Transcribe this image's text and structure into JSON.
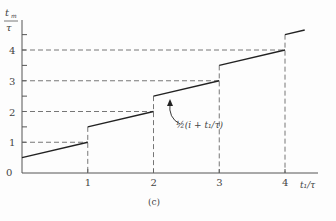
{
  "chart_data": {
    "type": "line",
    "title": "",
    "caption": "(c)",
    "xlabel": "t₁/τ",
    "ylabel_num": "t",
    "ylabel_sub": "m",
    "ylabel_den": "τ",
    "xlim": [
      0,
      4.35
    ],
    "ylim": [
      0,
      4.6
    ],
    "x_ticks": [
      0,
      1,
      2,
      3,
      4
    ],
    "x_tick_labels": [
      "0",
      "1",
      "2",
      "3",
      "4"
    ],
    "y_ticks": [
      1,
      2,
      3,
      4
    ],
    "y_tick_labels": [
      "1",
      "2",
      "3",
      "4"
    ],
    "y_minor_ticks": [
      1.5,
      2.5,
      3.5,
      4.5
    ],
    "grid": false,
    "series": [
      {
        "name": "½(i + t₁/τ)",
        "segments": [
          {
            "x": [
              0,
              1
            ],
            "y": [
              0.5,
              1.0
            ]
          },
          {
            "x": [
              1,
              2
            ],
            "y": [
              1.5,
              2.0
            ]
          },
          {
            "x": [
              2,
              3
            ],
            "y": [
              2.5,
              3.0
            ]
          },
          {
            "x": [
              3,
              4
            ],
            "y": [
              3.5,
              4.0
            ]
          },
          {
            "x": [
              4,
              4.3
            ],
            "y": [
              4.5,
              4.65
            ]
          }
        ]
      }
    ],
    "annotations": [
      {
        "text": "½(i + t₁/τ)",
        "arrow_to": [
          2.3,
          2.65
        ]
      }
    ],
    "dashed_guides": "horizontal at y=1,2,3,4 from axis to x=1,2,3,4; vertical at x=1,2,3,4 down to axis"
  }
}
